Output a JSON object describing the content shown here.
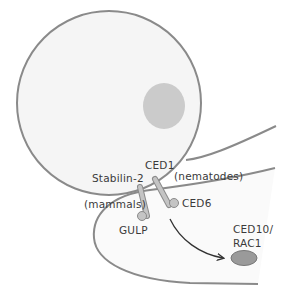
{
  "figure": {
    "type": "cell-engulfment-diagram",
    "labels": {
      "ced1": "CED1",
      "stabilin2": "Stabilin-2",
      "nematodes": "(nematodes)",
      "mammals": "(mammals)",
      "ced6": "CED6",
      "gulp": "GULP",
      "ced10_line1": "CED10/",
      "ced10_line2": "RAC1"
    },
    "colors": {
      "outline": "#8a8a8a",
      "cell_fill": "#f5f5f5",
      "nucleus_fill": "#c8c8c8",
      "receptor_fill": "#bdbdbd",
      "target_fill": "#9a9a9a",
      "arrow": "#333333",
      "text": "#3a3a3a"
    },
    "components": [
      {
        "name": "apoptotic-cell",
        "shape": "circle"
      },
      {
        "name": "nucleus",
        "shape": "circle"
      },
      {
        "name": "engulfing-cell",
        "shape": "curved-membrane"
      },
      {
        "name": "receptor-stabilin-2-ced1",
        "shape": "rod"
      },
      {
        "name": "adaptor-gulp",
        "shape": "ball"
      },
      {
        "name": "adaptor-ced6",
        "shape": "ball"
      },
      {
        "name": "signal-arrow",
        "shape": "arrow"
      },
      {
        "name": "ced10-rac1",
        "shape": "ellipse"
      }
    ]
  }
}
